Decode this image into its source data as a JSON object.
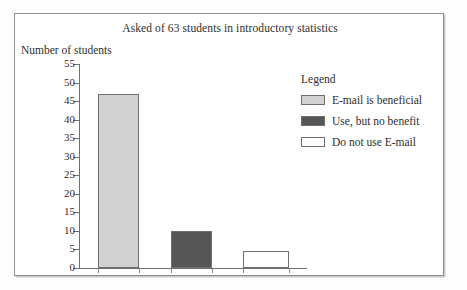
{
  "chart_data": {
    "type": "bar",
    "title": "Asked of 63 students in introductory statistics",
    "xlabel": "",
    "ylabel": "Number of students",
    "categories": [
      "E-mail is beneficial",
      "Use, but no benefit",
      "Do not use E-mail"
    ],
    "values": [
      47,
      10,
      4.5
    ],
    "ylim": [
      0,
      55
    ],
    "ytick_labels": [
      "55",
      "50",
      "45",
      "40",
      "35",
      "30",
      "25",
      "20",
      "15",
      "10",
      "5",
      "0"
    ],
    "ytick_values": [
      55,
      50,
      45,
      40,
      35,
      30,
      25,
      20,
      15,
      10,
      5,
      0
    ],
    "grid": false,
    "legend_position": "right",
    "legend_title": "Legend",
    "series": [
      {
        "name": "E-mail is beneficial",
        "value": 47,
        "color": "#d2d2d2",
        "swatch_name": "legend-swatch-beneficial"
      },
      {
        "name": "Use, but no benefit",
        "value": 10,
        "color": "#565656",
        "swatch_name": "legend-swatch-no-benefit"
      },
      {
        "name": "Do not use E-mail",
        "value": 4.5,
        "color": "#ffffff",
        "swatch_name": "legend-swatch-do-not-use"
      }
    ]
  },
  "colors": {
    "bar_beneficial": "#d2d2d2",
    "bar_no_benefit": "#565656",
    "bar_do_not_use": "#ffffff",
    "axis": "#6f6f6f",
    "frame": "#8e8e8e",
    "text": "#2e2e2e"
  }
}
